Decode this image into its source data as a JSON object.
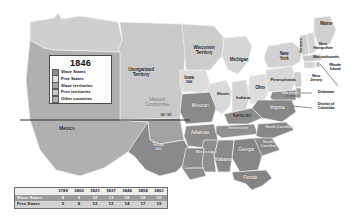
{
  "map": {
    "title_year": "1846",
    "legend": {
      "items": [
        {
          "label": "Slave States",
          "color": "#8c8c8c"
        },
        {
          "label": "Free States",
          "color": "#d9d9d9"
        },
        {
          "label": "Slave territories",
          "color": "#a8a8a8"
        },
        {
          "label": "Free territories",
          "color": "#c4c4c4"
        },
        {
          "label": "Other countries",
          "color": "#b3b3b3"
        }
      ]
    },
    "annotations": {
      "unorganized_territory": "Unorganized\nTerritory",
      "unorganized_line1": "Unorganized",
      "unorganized_line2": "Territory",
      "missouri_compromise_line1": "Missouri",
      "missouri_compromise_line2": "Compromise",
      "latitude_label": "36° 30'",
      "mexico": "Mexico"
    },
    "states": [
      {
        "name": "Wisconsin Territory",
        "line1": "Wisconsin",
        "line2": "Territory",
        "year": ""
      },
      {
        "name": "Michigan",
        "line1": "Michigan",
        "line2": "",
        "year": ""
      },
      {
        "name": "Iowa",
        "line1": "Iowa",
        "line2": "",
        "year": "1846"
      },
      {
        "name": "Illinois",
        "line1": "Illinois",
        "line2": "",
        "year": ""
      },
      {
        "name": "Indiana",
        "line1": "Indiana",
        "line2": "",
        "year": ""
      },
      {
        "name": "Ohio",
        "line1": "Ohio",
        "line2": "",
        "year": ""
      },
      {
        "name": "Pennsylvania",
        "line1": "Pennsylvania",
        "line2": "",
        "year": ""
      },
      {
        "name": "New York",
        "line1": "New",
        "line2": "York",
        "year": ""
      },
      {
        "name": "Vermont",
        "line1": "Vermont",
        "line2": "",
        "year": ""
      },
      {
        "name": "Maine",
        "line1": "Maine",
        "line2": "",
        "year": ""
      },
      {
        "name": "New Hampshire",
        "line1": "New",
        "line2": "Hampshire",
        "year": ""
      },
      {
        "name": "Massachusetts",
        "line1": "Massachusetts",
        "line2": "",
        "year": ""
      },
      {
        "name": "Rhode Island",
        "line1": "Rhode",
        "line2": "Island",
        "year": ""
      },
      {
        "name": "New Jersey",
        "line1": "New",
        "line2": "Jersey",
        "year": ""
      },
      {
        "name": "Delaware",
        "line1": "Delaware",
        "line2": "",
        "year": ""
      },
      {
        "name": "Maryland",
        "line1": "Maryland",
        "line2": "",
        "year": ""
      },
      {
        "name": "District of Columbia",
        "line1": "District of",
        "line2": "Columbia",
        "year": ""
      },
      {
        "name": "Virginia",
        "line1": "Virginia",
        "line2": "",
        "year": ""
      },
      {
        "name": "Kentucky",
        "line1": "Kentucky",
        "line2": "",
        "year": ""
      },
      {
        "name": "Missouri",
        "line1": "Missouri",
        "line2": "",
        "year": ""
      },
      {
        "name": "Arkansas",
        "line1": "Arkansas",
        "line2": "",
        "year": ""
      },
      {
        "name": "Tennessee",
        "line1": "Tennessee",
        "line2": "",
        "year": ""
      },
      {
        "name": "North Carolina",
        "line1": "North Carolina",
        "line2": "",
        "year": ""
      },
      {
        "name": "South Carolina",
        "line1": "South",
        "line2": "Carolina",
        "year": ""
      },
      {
        "name": "Georgia",
        "line1": "Georgia",
        "line2": "",
        "year": ""
      },
      {
        "name": "Alabama",
        "line1": "Alabama",
        "line2": "",
        "year": ""
      },
      {
        "name": "Mississippi",
        "line1": "Mississippi",
        "line2": "",
        "year": ""
      },
      {
        "name": "Louisiana",
        "line1": "Louisiana",
        "line2": "",
        "year": ""
      },
      {
        "name": "Florida",
        "line1": "Florida",
        "line2": "",
        "year": ""
      },
      {
        "name": "Texas",
        "line1": "Texas",
        "line2": "",
        "year": "1845"
      }
    ]
  },
  "table": {
    "years": [
      "1789",
      "1800",
      "1821",
      "1837",
      "1846",
      "1858",
      "1861"
    ],
    "rows": [
      {
        "label": "Slave States",
        "values": [
          "8",
          "9",
          "12",
          "13",
          "15",
          "15",
          "15"
        ]
      },
      {
        "label": "Free States",
        "values": [
          "5",
          "8",
          "12",
          "13",
          "14",
          "17",
          "19"
        ]
      }
    ]
  },
  "colors": {
    "slave_state": "#8c8c8c",
    "free_state": "#d9d9d9",
    "slave_territory": "#a8a8a8",
    "free_territory": "#c4c4c4",
    "other_country": "#b3b3b3",
    "background": "#ffffff",
    "border": "#f0f0f0"
  }
}
